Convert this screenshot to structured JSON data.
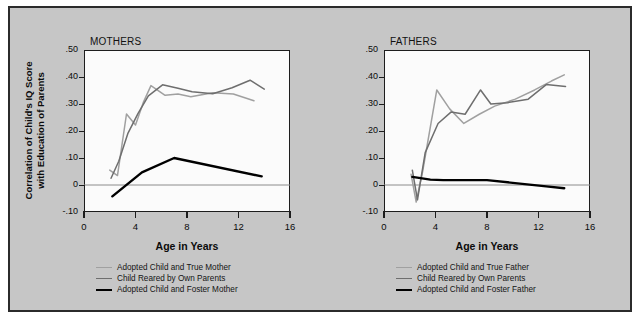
{
  "figure": {
    "background_color": "#c6c6c6",
    "border_color": "#2b2b2b",
    "plot_background_color": "#fbfbfb"
  },
  "colors": {
    "series_true_parent": "#a0a0a0",
    "series_own_parents": "#6e6e6e",
    "series_foster_parent": "#000000",
    "axis": "#1d1d1d",
    "zero_line": "#8c8c8c",
    "text": "#0b0b0b"
  },
  "axis": {
    "ylabel_line1": "Correlation of Child's IQ Score",
    "ylabel_line2": "with Education of Parents",
    "xlabel": "Age in Years",
    "yticks": [
      ".50",
      ".40",
      ".30",
      ".20",
      ".10",
      "0",
      "-.10"
    ],
    "ytick_values": [
      0.5,
      0.4,
      0.3,
      0.2,
      0.1,
      0.0,
      -0.1
    ],
    "xticks": [
      "0",
      "4",
      "8",
      "12",
      "16"
    ],
    "xtick_values": [
      0,
      4,
      8,
      12,
      16
    ],
    "ylim": [
      -0.1,
      0.5
    ],
    "xlim": [
      0,
      16
    ],
    "grid": false
  },
  "chart_data": [
    {
      "type": "line",
      "title": "MOTHERS",
      "xlabel": "Age in Years",
      "ylabel": "Correlation of Child's IQ Score with Education of Parents",
      "xlim": [
        0,
        16
      ],
      "ylim": [
        -0.1,
        0.5
      ],
      "grid": false,
      "legend_position": "below",
      "series": [
        {
          "name": "Adopted Child and True Mother",
          "color": "#a0a0a0",
          "x": [
            2.0,
            2.6,
            3.3,
            4.0,
            4.6,
            5.2,
            6.3,
            7.3,
            8.3,
            10.0,
            11.6,
            13.2
          ],
          "y": [
            0.055,
            0.035,
            0.263,
            0.222,
            0.305,
            0.368,
            0.332,
            0.337,
            0.327,
            0.342,
            0.337,
            0.312
          ]
        },
        {
          "name": "Child Reared by Own Parents",
          "color": "#6e6e6e",
          "x": [
            2.1,
            2.7,
            3.4,
            4.2,
            5.0,
            6.1,
            7.3,
            8.4,
            10.0,
            11.5,
            12.9,
            14.0
          ],
          "y": [
            0.025,
            0.088,
            0.19,
            0.265,
            0.33,
            0.371,
            0.358,
            0.345,
            0.338,
            0.36,
            0.388,
            0.355
          ]
        },
        {
          "name": "Adopted Child and Foster Mother",
          "color": "#000000",
          "x": [
            2.2,
            4.5,
            7.0,
            13.8
          ],
          "y": [
            -0.042,
            0.047,
            0.1,
            0.032
          ]
        }
      ]
    },
    {
      "type": "line",
      "title": "FATHERS",
      "xlabel": "Age in Years",
      "ylabel": "Correlation of Child's IQ Score with Education of Parents",
      "xlim": [
        0,
        16
      ],
      "ylim": [
        -0.1,
        0.5
      ],
      "grid": false,
      "legend_position": "below",
      "series": [
        {
          "name": "Adopted Child and True Father",
          "color": "#a0a0a0",
          "x": [
            2.1,
            2.5,
            3.0,
            4.1,
            5.1,
            6.2,
            7.4,
            8.6,
            10.2,
            11.7,
            13.0,
            14.0
          ],
          "y": [
            0.04,
            -0.063,
            0.05,
            0.352,
            0.282,
            0.228,
            0.262,
            0.292,
            0.318,
            0.352,
            0.385,
            0.408
          ]
        },
        {
          "name": "Child Reared by Own Parents",
          "color": "#6e6e6e",
          "x": [
            2.2,
            2.6,
            3.2,
            4.2,
            5.2,
            6.3,
            7.5,
            8.3,
            9.6,
            11.2,
            12.6,
            14.1
          ],
          "y": [
            0.055,
            -0.055,
            0.12,
            0.228,
            0.27,
            0.262,
            0.352,
            0.3,
            0.305,
            0.318,
            0.372,
            0.365
          ]
        },
        {
          "name": "Adopted Child and Foster Father",
          "color": "#000000",
          "x": [
            2.2,
            3.6,
            4.6,
            8.0,
            12.6,
            14.0
          ],
          "y": [
            0.03,
            0.02,
            0.018,
            0.018,
            -0.005,
            -0.012
          ]
        }
      ]
    }
  ],
  "legends": [
    {
      "panel": "MOTHERS",
      "entries": [
        {
          "label": "Adopted Child and True Mother",
          "color": "#a0a0a0",
          "thickness": 1.6
        },
        {
          "label": "Child Reared by Own Parents",
          "color": "#6e6e6e",
          "thickness": 1.6
        },
        {
          "label": "Adopted Child and Foster Mother",
          "color": "#000000",
          "thickness": 2.6
        }
      ]
    },
    {
      "panel": "FATHERS",
      "entries": [
        {
          "label": "Adopted Child and True Father",
          "color": "#a0a0a0",
          "thickness": 1.6
        },
        {
          "label": "Child Reared by Own Parents",
          "color": "#6e6e6e",
          "thickness": 1.6
        },
        {
          "label": "Adopted Child and Foster Father",
          "color": "#000000",
          "thickness": 2.6
        }
      ]
    }
  ]
}
